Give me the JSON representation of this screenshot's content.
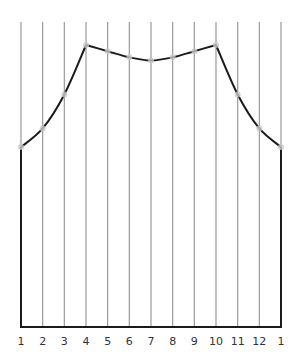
{
  "chart_data": {
    "type": "line",
    "title": "",
    "xlabel": "",
    "ylabel": "",
    "x_tick_labels": [
      "1",
      "2",
      "3",
      "4",
      "5",
      "6",
      "7",
      "8",
      "9",
      "10",
      "11",
      "12",
      "1"
    ],
    "grid": "vertical lines at each tick",
    "ylim": [
      0,
      100
    ],
    "series": [
      {
        "name": "profile",
        "values": [
          59,
          65,
          76,
          92,
          90,
          88,
          87,
          88,
          90,
          92,
          76,
          65,
          59
        ]
      }
    ],
    "markers": "faint dots at each point",
    "closed_shape": "curve connected down to baseline at both ends, baseline spans full width"
  },
  "colors": {
    "grid": "#9a9a9a",
    "curve": "#1a1a1a",
    "marker": "#c8c8c8",
    "label": "#333333"
  }
}
